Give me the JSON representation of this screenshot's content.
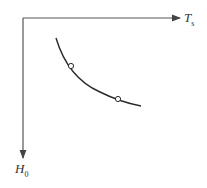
{
  "diagram": {
    "x_axis": {
      "label": "T",
      "subscript": "s",
      "direction": "right"
    },
    "y_axis": {
      "label": "H",
      "subscript": "0",
      "direction": "down"
    },
    "curve": {
      "shape": "decreasing-convex",
      "points": [
        [
          56,
          38
        ],
        [
          71,
          66
        ],
        [
          118,
          99
        ],
        [
          141,
          106
        ]
      ],
      "markers": [
        {
          "name": "marker-1",
          "x": 71,
          "y": 66
        },
        {
          "name": "marker-2",
          "x": 118,
          "y": 99
        }
      ]
    },
    "colors": {
      "line": "#2a2a2a",
      "axis": "#555555",
      "background": "#ffffff"
    }
  }
}
